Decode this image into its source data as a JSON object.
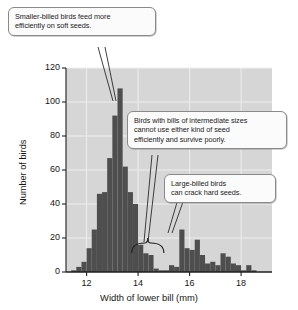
{
  "chart_data": {
    "type": "bar",
    "title": "",
    "subtitle": "",
    "xlabel": "Width of lower bill (mm)",
    "ylabel": "Number of birds",
    "xlim": [
      11.2,
      19.2
    ],
    "ylim": [
      0,
      120
    ],
    "xticks": [
      12,
      14,
      16,
      18
    ],
    "yticks": [
      0,
      20,
      40,
      60,
      80,
      100,
      120
    ],
    "grid": true,
    "legend": null,
    "bin_width": 0.2,
    "bin_starts": [
      11.4,
      11.6,
      11.8,
      12.0,
      12.2,
      12.4,
      12.6,
      12.8,
      13.0,
      13.2,
      13.4,
      13.6,
      13.8,
      14.0,
      14.2,
      14.4,
      14.6,
      14.8,
      15.0,
      15.2,
      15.4,
      15.6,
      15.8,
      16.0,
      16.2,
      16.4,
      16.6,
      16.8,
      17.0,
      17.2,
      17.4,
      17.6,
      17.8,
      18.0,
      18.2,
      18.4
    ],
    "values": [
      1,
      3,
      6,
      14,
      25,
      46,
      47,
      67,
      92,
      108,
      62,
      47,
      40,
      16,
      11,
      10,
      2,
      1,
      1,
      4,
      3,
      25,
      14,
      13,
      19,
      10,
      5,
      6,
      4,
      11,
      9,
      5,
      4,
      1,
      4,
      1
    ],
    "categories": [
      "11.4",
      "11.6",
      "11.8",
      "12.0",
      "12.2",
      "12.4",
      "12.6",
      "12.8",
      "13.0",
      "13.2",
      "13.4",
      "13.6",
      "13.8",
      "14.0",
      "14.2",
      "14.4",
      "14.6",
      "14.8",
      "15.0",
      "15.2",
      "15.4",
      "15.6",
      "15.8",
      "16.0",
      "16.2",
      "16.4",
      "16.6",
      "16.8",
      "17.0",
      "17.2",
      "17.4",
      "17.6",
      "17.8",
      "18.0",
      "18.2",
      "18.4"
    ],
    "annotations": [
      {
        "name": "soft-seeds",
        "text": "Smaller-billed birds feed more efficiently on soft seeds.",
        "points_to_x": 12.85
      },
      {
        "name": "intermediate",
        "text": "Birds with bills of intermediate sizes cannot use either kind of seed efficiently and survive poorly.",
        "points_to_x": 14.4
      },
      {
        "name": "hard-seeds",
        "text": "Large-billed birds can crack hard seeds.",
        "points_to_x": 15.7
      }
    ],
    "brace": {
      "from_x": 13.75,
      "to_x": 15.0,
      "label": ""
    },
    "colors": {
      "bar": "#4e4e4e",
      "plot_background": "#d6d6d6",
      "gridline": "#eeeeee",
      "axis": "#1f1f1f",
      "callout_fill": "#fbfbfb",
      "callout_border": "#8a8a8a",
      "page_background": "#ffffff"
    }
  },
  "callouts": {
    "soft_seeds": {
      "line1": "Smaller-billed birds feed more",
      "line2": "efficiently on soft seeds."
    },
    "intermediate": {
      "line1": "Birds with bills of intermediate sizes",
      "line2": "cannot use either kind of seed",
      "line3": "efficiently and survive poorly."
    },
    "hard_seeds": {
      "line1": "Large-billed birds",
      "line2": "can crack hard seeds."
    }
  },
  "axes": {
    "y_label": "Number of birds",
    "x_label": "Width of lower bill (mm)",
    "y_ticks": [
      "120",
      "100",
      "80",
      "60",
      "40",
      "20",
      "0"
    ],
    "x_ticks": [
      "12",
      "14",
      "16",
      "18"
    ]
  }
}
